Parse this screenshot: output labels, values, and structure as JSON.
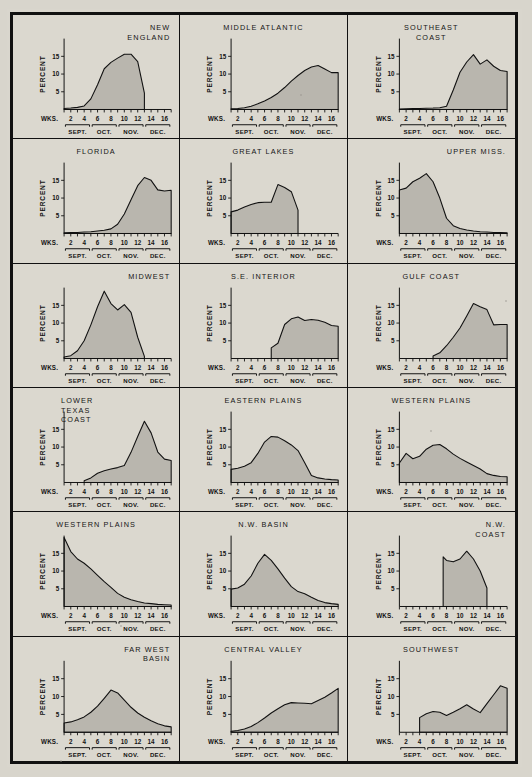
{
  "figure": {
    "axis": {
      "y_label": "PERCENT",
      "y_ticks": [
        5,
        10,
        15
      ],
      "y_max": 20,
      "x_label": "WKS.",
      "x_ticks": [
        2,
        4,
        6,
        8,
        10,
        12,
        14,
        16
      ],
      "x_min": 1,
      "x_max": 17,
      "months": [
        "SEPT.",
        "OCT.",
        "NOV.",
        "DEC."
      ],
      "month_spans": [
        [
          1.2,
          4.8
        ],
        [
          5.2,
          8.8
        ],
        [
          9.2,
          12.8
        ],
        [
          13.2,
          16.8
        ]
      ]
    },
    "colors": {
      "ink": "#111111",
      "fill": "#b9b6ae",
      "paper": "#d9d6cd",
      "page": "#c9c6bd"
    }
  },
  "chart_data": [
    {
      "type": "area",
      "title": "NEW\nENGLAND",
      "title_align": "right",
      "xlabel": "WKS.",
      "ylabel": "PERCENT",
      "ylim": [
        0,
        20
      ],
      "xlim": [
        1,
        17
      ],
      "x": [
        1,
        2,
        3,
        4,
        5,
        6,
        7,
        8,
        9,
        10,
        11,
        12,
        13
      ],
      "values": [
        0.3,
        0.4,
        0.6,
        1.0,
        3.0,
        7.0,
        11.5,
        13.3,
        14.5,
        15.6,
        15.6,
        13.5,
        4.6
      ],
      "truncated_right": true
    },
    {
      "type": "area",
      "title": "MIDDLE ATLANTIC",
      "title_align": "center",
      "xlabel": "WKS.",
      "ylabel": "PERCENT",
      "ylim": [
        0,
        20
      ],
      "xlim": [
        1,
        17
      ],
      "x": [
        1,
        2,
        3,
        4,
        5,
        6,
        7,
        8,
        9,
        10,
        11,
        12,
        13,
        14,
        15,
        16,
        17
      ],
      "values": [
        0.2,
        0.3,
        0.5,
        0.9,
        1.6,
        2.4,
        3.4,
        4.6,
        6.2,
        8.0,
        9.6,
        11.0,
        12.0,
        12.4,
        11.4,
        10.4,
        10.4
      ]
    },
    {
      "type": "area",
      "title": "SOUTHEAST\nCOAST",
      "title_align": "center",
      "xlabel": "WKS.",
      "ylabel": "PERCENT",
      "ylim": [
        0,
        20
      ],
      "xlim": [
        1,
        17
      ],
      "x": [
        1,
        2,
        3,
        4,
        5,
        6,
        7,
        8,
        9,
        10,
        11,
        12,
        13,
        14,
        15,
        16,
        17
      ],
      "values": [
        0.15,
        0.2,
        0.25,
        0.3,
        0.35,
        0.4,
        0.5,
        0.9,
        5.5,
        10.5,
        13.4,
        15.5,
        12.8,
        14.0,
        12.2,
        11.0,
        10.7
      ]
    },
    {
      "type": "area",
      "title": "FLORIDA",
      "title_align": "center",
      "xlabel": "WKS.",
      "ylabel": "PERCENT",
      "ylim": [
        0,
        20
      ],
      "xlim": [
        1,
        17
      ],
      "x": [
        1,
        2,
        3,
        4,
        5,
        6,
        7,
        8,
        9,
        10,
        11,
        12,
        13,
        14,
        15,
        16,
        17
      ],
      "values": [
        0.2,
        0.25,
        0.3,
        0.4,
        0.5,
        0.7,
        0.9,
        1.3,
        2.6,
        5.5,
        9.5,
        13.5,
        15.8,
        15.0,
        12.3,
        12.0,
        12.2
      ]
    },
    {
      "type": "area",
      "title": "GREAT LAKES",
      "title_align": "center",
      "xlabel": "WKS.",
      "ylabel": "PERCENT",
      "ylim": [
        0,
        20
      ],
      "xlim": [
        1,
        17
      ],
      "x": [
        1,
        2,
        3,
        4,
        5,
        6,
        7,
        8,
        9,
        10,
        11
      ],
      "values": [
        6.1,
        6.6,
        7.5,
        8.2,
        8.7,
        8.8,
        8.8,
        13.8,
        13.0,
        11.8,
        6.6
      ],
      "truncated_right": true
    },
    {
      "type": "area",
      "title": "UPPER MISS.",
      "title_align": "right",
      "xlabel": "WKS.",
      "ylabel": "PERCENT",
      "ylim": [
        0,
        20
      ],
      "xlim": [
        1,
        17
      ],
      "x": [
        1,
        2,
        3,
        4,
        5,
        6,
        7,
        8,
        9,
        10,
        11,
        12,
        13,
        14,
        15,
        16,
        17
      ],
      "values": [
        12.3,
        12.8,
        14.6,
        15.6,
        16.9,
        14.6,
        10.0,
        4.3,
        2.2,
        1.4,
        1.0,
        0.7,
        0.5,
        0.4,
        0.3,
        0.25,
        0.2
      ],
      "truncated_left": true
    },
    {
      "type": "area",
      "title": "MIDWEST",
      "title_align": "right",
      "xlabel": "WKS.",
      "ylabel": "PERCENT",
      "ylim": [
        0,
        20
      ],
      "xlim": [
        1,
        17
      ],
      "x": [
        1,
        2,
        3,
        4,
        5,
        6,
        7,
        8,
        9,
        10,
        11,
        12,
        13
      ],
      "values": [
        0.4,
        0.8,
        2.2,
        5.0,
        9.5,
        14.6,
        19.0,
        15.5,
        13.7,
        15.2,
        13.0,
        6.0,
        0.6
      ]
    },
    {
      "type": "area",
      "title": "S.E. INTERIOR",
      "title_align": "center",
      "xlabel": "WKS.",
      "ylabel": "PERCENT",
      "ylim": [
        0,
        20
      ],
      "xlim": [
        1,
        17
      ],
      "x": [
        7,
        8,
        9,
        10,
        11,
        12,
        13,
        14,
        15,
        16,
        17
      ],
      "values": [
        3.0,
        4.3,
        9.6,
        11.2,
        11.7,
        10.7,
        11.0,
        10.8,
        10.2,
        9.3,
        9.1
      ],
      "truncated_left": true
    },
    {
      "type": "area",
      "title": "GULF COAST",
      "title_align": "center",
      "xlabel": "WKS.",
      "ylabel": "PERCENT",
      "ylim": [
        0,
        20
      ],
      "xlim": [
        1,
        17
      ],
      "x": [
        6,
        7,
        8,
        9,
        10,
        11,
        12,
        13,
        14,
        15,
        16,
        17
      ],
      "values": [
        0.7,
        1.6,
        3.6,
        6.0,
        8.6,
        12.0,
        15.5,
        14.6,
        13.8,
        9.5,
        9.6,
        9.6
      ]
    },
    {
      "type": "area",
      "title": "LOWER\nTEXAS\nCOAST",
      "title_align": "left",
      "xlabel": "WKS.",
      "ylabel": "PERCENT",
      "ylim": [
        0,
        20
      ],
      "xlim": [
        1,
        17
      ],
      "x": [
        4,
        5,
        6,
        7,
        8,
        9,
        10,
        11,
        12,
        13,
        14,
        15,
        16,
        17
      ],
      "values": [
        0.5,
        1.3,
        2.6,
        3.3,
        3.8,
        4.2,
        4.8,
        8.5,
        13.0,
        17.3,
        14.0,
        8.6,
        6.6,
        6.2
      ]
    },
    {
      "type": "area",
      "title": "EASTERN PLAINS",
      "title_align": "center",
      "xlabel": "WKS.",
      "ylabel": "PERCENT",
      "ylim": [
        0,
        20
      ],
      "xlim": [
        1,
        17
      ],
      "x": [
        1,
        2,
        3,
        4,
        5,
        6,
        7,
        8,
        9,
        10,
        11,
        12,
        13,
        14,
        15,
        16,
        17
      ],
      "values": [
        3.7,
        4.0,
        4.6,
        5.6,
        8.2,
        11.4,
        13.0,
        12.8,
        11.8,
        10.6,
        9.0,
        5.6,
        2.0,
        1.3,
        1.0,
        0.8,
        0.7
      ]
    },
    {
      "type": "area",
      "title": "WESTERN PLAINS",
      "title_align": "center",
      "xlabel": "WKS.",
      "ylabel": "PERCENT",
      "ylim": [
        0,
        20
      ],
      "xlim": [
        1,
        17
      ],
      "x": [
        1,
        2,
        3,
        4,
        5,
        6,
        7,
        8,
        9,
        10,
        11,
        12,
        13,
        14,
        15,
        16,
        17
      ],
      "values": [
        5.5,
        8.2,
        6.7,
        7.4,
        9.4,
        10.5,
        10.7,
        9.5,
        8.0,
        6.8,
        5.8,
        4.8,
        3.8,
        2.5,
        2.0,
        1.7,
        1.6
      ]
    },
    {
      "type": "area",
      "title": "WESTERN PLAINS",
      "title_align": "center",
      "xlabel": "WKS.",
      "ylabel": "PERCENT",
      "ylim": [
        0,
        20
      ],
      "xlim": [
        1,
        17
      ],
      "x": [
        1,
        2,
        3,
        4,
        5,
        6,
        7,
        8,
        9,
        10,
        11,
        12,
        13,
        14,
        15,
        16,
        17
      ],
      "values": [
        19.5,
        15.5,
        13.4,
        12.2,
        10.6,
        8.8,
        7.0,
        5.4,
        3.7,
        2.6,
        1.9,
        1.4,
        1.0,
        0.8,
        0.6,
        0.5,
        0.4
      ]
    },
    {
      "type": "area",
      "title": "N.W. BASIN",
      "title_align": "center",
      "xlabel": "WKS.",
      "ylabel": "PERCENT",
      "ylim": [
        0,
        20
      ],
      "xlim": [
        1,
        17
      ],
      "x": [
        1,
        2,
        3,
        4,
        5,
        6,
        7,
        8,
        9,
        10,
        11,
        12,
        13,
        14,
        15,
        16,
        17
      ],
      "values": [
        4.9,
        5.2,
        6.3,
        8.6,
        12.2,
        14.7,
        13.0,
        10.6,
        8.0,
        5.6,
        4.2,
        3.6,
        2.6,
        1.7,
        1.1,
        0.8,
        0.6
      ]
    },
    {
      "type": "area",
      "title": "N.W.\nCOAST",
      "title_align": "right",
      "xlabel": "WKS.",
      "ylabel": "PERCENT",
      "ylim": [
        0,
        20
      ],
      "xlim": [
        1,
        17
      ],
      "x": [
        7.5,
        8,
        9,
        10,
        11,
        12,
        13,
        14
      ],
      "values": [
        14.0,
        13.0,
        12.6,
        13.4,
        15.6,
        13.4,
        10.0,
        5.2
      ],
      "truncated_left": true,
      "truncated_right": true
    },
    {
      "type": "area",
      "title": "FAR WEST\nBASIN",
      "title_align": "right",
      "xlabel": "WKS.",
      "ylabel": "PERCENT",
      "ylim": [
        0,
        20
      ],
      "xlim": [
        1,
        17
      ],
      "x": [
        1,
        2,
        3,
        4,
        5,
        6,
        7,
        8,
        9,
        10,
        11,
        12,
        13,
        14,
        15,
        16,
        17
      ],
      "values": [
        2.6,
        2.9,
        3.5,
        4.3,
        5.6,
        7.3,
        9.5,
        11.8,
        11.0,
        9.0,
        7.0,
        5.4,
        4.2,
        3.2,
        2.4,
        1.8,
        1.5
      ]
    },
    {
      "type": "area",
      "title": "CENTRAL VALLEY",
      "title_align": "center",
      "xlabel": "WKS.",
      "ylabel": "PERCENT",
      "ylim": [
        0,
        20
      ],
      "xlim": [
        1,
        17
      ],
      "x": [
        1,
        2,
        3,
        4,
        5,
        6,
        7,
        8,
        9,
        10,
        11,
        12,
        13,
        14,
        15,
        16,
        17
      ],
      "values": [
        0.3,
        0.5,
        0.9,
        1.6,
        2.7,
        4.0,
        5.4,
        6.6,
        7.7,
        8.3,
        8.2,
        8.1,
        8.0,
        8.9,
        9.8,
        11.0,
        12.3
      ]
    },
    {
      "type": "area",
      "title": "SOUTHWEST",
      "title_align": "center",
      "xlabel": "WKS.",
      "ylabel": "PERCENT",
      "ylim": [
        0,
        20
      ],
      "xlim": [
        1,
        17
      ],
      "x": [
        4,
        5,
        6,
        7,
        8,
        9,
        10,
        11,
        12,
        13,
        14,
        15,
        16,
        17
      ],
      "values": [
        4.1,
        5.2,
        5.8,
        5.6,
        4.7,
        5.6,
        6.6,
        7.7,
        6.5,
        5.5,
        8.0,
        10.5,
        13.0,
        12.3
      ],
      "truncated_left": true
    }
  ]
}
